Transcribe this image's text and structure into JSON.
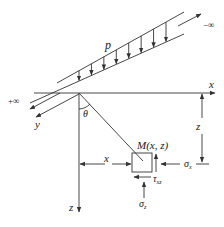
{
  "diagram": {
    "labels": {
      "load": "p",
      "neg_inf": "−∞",
      "pos_inf": "+∞",
      "x_axis": "x",
      "y_axis": "y",
      "z_axis": "z",
      "theta": "θ",
      "point": "M(x, z)",
      "dim_x": "x",
      "dim_z": "z",
      "sigma_x": "σ",
      "sigma_x_sub": "x",
      "sigma_z": "σ",
      "sigma_z_sub": "z",
      "tau": "τ",
      "tau_sub": "xz"
    },
    "load_arrow_count": 8,
    "colors": {
      "ink": "#333333",
      "background": "#ffffff"
    }
  }
}
